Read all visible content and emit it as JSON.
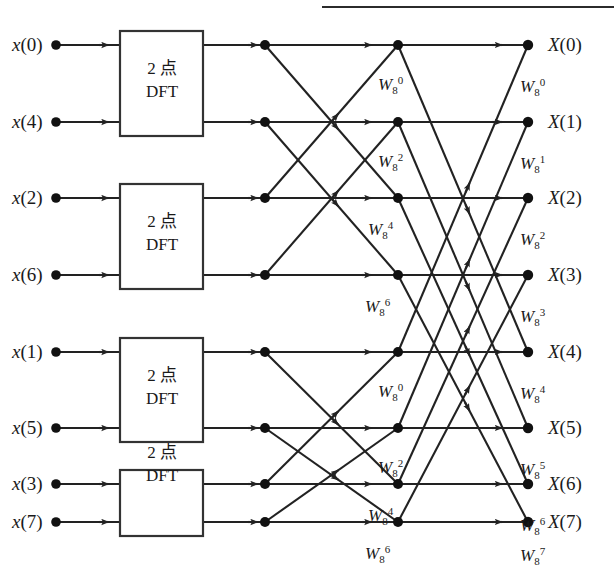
{
  "figure": {
    "title_partial": "",
    "header_rule": true,
    "type": "fft-butterfly-signal-flow-graph",
    "size": 8,
    "stages": 3
  },
  "blocks": [
    {
      "label_line1": "2 点",
      "label_line2": "DFT",
      "inputs": [
        "x(0)",
        "x(4)"
      ]
    },
    {
      "label_line1": "2 点",
      "label_line2": "DFT",
      "inputs": [
        "x(2)",
        "x(6)"
      ]
    },
    {
      "label_line1": "2 点",
      "label_line2": "DFT",
      "inputs": [
        "x(1)",
        "x(5)"
      ]
    },
    {
      "label_line1": "2 点",
      "label_line2": "DFT",
      "inputs": [
        "x(3)",
        "x(7)"
      ]
    }
  ],
  "inputs": [
    {
      "fn": "x",
      "index": "(0)"
    },
    {
      "fn": "x",
      "index": "(4)"
    },
    {
      "fn": "x",
      "index": "(2)"
    },
    {
      "fn": "x",
      "index": "(6)"
    },
    {
      "fn": "x",
      "index": "(1)"
    },
    {
      "fn": "x",
      "index": "(5)"
    },
    {
      "fn": "x",
      "index": "(3)"
    },
    {
      "fn": "x",
      "index": "(7)"
    }
  ],
  "outputs": [
    {
      "fn": "X",
      "index": "(0)"
    },
    {
      "fn": "X",
      "index": "(1)"
    },
    {
      "fn": "X",
      "index": "(2)"
    },
    {
      "fn": "X",
      "index": "(3)"
    },
    {
      "fn": "X",
      "index": "(4)"
    },
    {
      "fn": "X",
      "index": "(5)"
    },
    {
      "fn": "X",
      "index": "(6)"
    },
    {
      "fn": "X",
      "index": "(7)"
    }
  ],
  "twiddles_stage2": [
    {
      "base": "W",
      "sub": "8",
      "sup": "0"
    },
    {
      "base": "W",
      "sub": "8",
      "sup": "2"
    },
    {
      "base": "W",
      "sub": "8",
      "sup": "4"
    },
    {
      "base": "W",
      "sub": "8",
      "sup": "6"
    },
    {
      "base": "W",
      "sub": "8",
      "sup": "0"
    },
    {
      "base": "W",
      "sub": "8",
      "sup": "2"
    },
    {
      "base": "W",
      "sub": "8",
      "sup": "4"
    },
    {
      "base": "W",
      "sub": "8",
      "sup": "6"
    }
  ],
  "twiddles_stage3": [
    {
      "base": "W",
      "sub": "8",
      "sup": "0"
    },
    {
      "base": "W",
      "sub": "8",
      "sup": "1"
    },
    {
      "base": "W",
      "sub": "8",
      "sup": "2"
    },
    {
      "base": "W",
      "sub": "8",
      "sup": "3"
    },
    {
      "base": "W",
      "sub": "8",
      "sup": "4"
    },
    {
      "base": "W",
      "sub": "8",
      "sup": "5"
    },
    {
      "base": "W",
      "sub": "8",
      "sup": "6"
    },
    {
      "base": "W",
      "sub": "8",
      "sup": "7"
    }
  ],
  "colors": {
    "ink": "#1a1a1a",
    "line": "#222222",
    "background": "#ffffff"
  },
  "geometry": {
    "rows_y": [
      45,
      122,
      198,
      275,
      352,
      428,
      505,
      522
    ],
    "node_cols_x": [
      265,
      398,
      528
    ],
    "box_x": [
      120,
      203
    ]
  }
}
